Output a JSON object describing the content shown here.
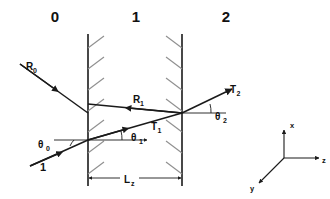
{
  "figure": {
    "background_color": "#ffffff",
    "line_color": "#1a1a1a",
    "hatch_color": "#8a8a8a",
    "width": 330,
    "height": 199
  },
  "regions": [
    {
      "label": "0",
      "x": 55,
      "y": 22
    },
    {
      "label": "1",
      "x": 136,
      "y": 22
    },
    {
      "label": "2",
      "x": 226,
      "y": 22
    }
  ],
  "interfaces": [
    {
      "name": "interface-left",
      "x": 88,
      "y_top": 34,
      "y_bottom": 186,
      "hatch_direction": "up-right"
    },
    {
      "name": "interface-right",
      "x": 182,
      "y_top": 34,
      "y_bottom": 186,
      "hatch_direction": "up-left"
    }
  ],
  "rays": [
    {
      "name": "incident-ray",
      "label": "1",
      "label_x": 43,
      "label_y": 171
    },
    {
      "name": "reflected-ray-region0",
      "label": "R",
      "subscript": "0",
      "label_x": 26,
      "label_y": 70
    },
    {
      "name": "internal-reflected-ray",
      "label": "R",
      "subscript": "1",
      "label_x": 133,
      "label_y": 103
    },
    {
      "name": "transmitted-ray-region1",
      "label": "T",
      "subscript": "1",
      "label_x": 151,
      "label_y": 130
    },
    {
      "name": "transmitted-ray-region2",
      "label": "T",
      "subscript": "2",
      "label_x": 230,
      "label_y": 93
    }
  ],
  "angles": [
    {
      "name": "theta-0",
      "symbol": "θ",
      "subscript": "0",
      "label_x": 38,
      "label_y": 148
    },
    {
      "name": "theta-1",
      "symbol": "θ",
      "subscript": "1",
      "label_x": 131,
      "label_y": 141
    },
    {
      "name": "theta-2",
      "symbol": "θ",
      "subscript": "2",
      "label_x": 215,
      "label_y": 120
    }
  ],
  "dimension": {
    "name": "slab-thickness",
    "label": "L",
    "subscript": "z",
    "label_x": 128,
    "label_y": 183,
    "y": 178,
    "x_start": 88,
    "x_end": 182
  },
  "coordinate_axes": {
    "name": "coordinate-triad",
    "origin_x": 284,
    "origin_y": 158,
    "axes": [
      {
        "label": "x",
        "direction": "up",
        "label_x": 290,
        "label_y": 125
      },
      {
        "label": "z",
        "direction": "right",
        "label_x": 323,
        "label_y": 162
      },
      {
        "label": "y",
        "direction": "down-left",
        "label_x": 250,
        "label_y": 190
      }
    ]
  }
}
